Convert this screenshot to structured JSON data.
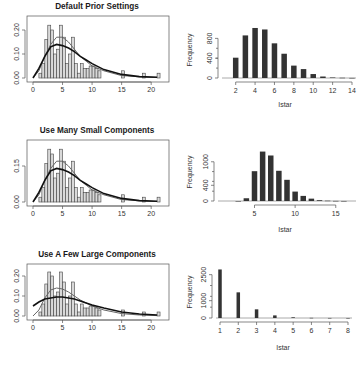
{
  "chart_data": [
    {
      "type": "bar",
      "panel": "row1-left",
      "title": "Default Prior Settings",
      "xlabel": "",
      "ylabel": "",
      "xlim": [
        0,
        22
      ],
      "ylim": [
        0,
        0.25
      ],
      "xticks": [
        "0",
        "5",
        "10",
        "15",
        "20"
      ],
      "yticks": [
        "0.00",
        "0.10",
        "0.20"
      ],
      "histogram": {
        "bin_width": 0.5,
        "x": [
          1.0,
          1.5,
          2.0,
          2.5,
          3.0,
          3.5,
          4.0,
          4.5,
          5.0,
          5.5,
          6.0,
          6.5,
          7.0,
          7.5,
          8.0,
          8.5,
          9.0,
          9.5,
          10.0,
          10.5,
          11.0,
          15.0,
          18.5,
          21.0
        ],
        "density": [
          0.02,
          0.06,
          0.16,
          0.22,
          0.2,
          0.1,
          0.12,
          0.22,
          0.17,
          0.06,
          0.1,
          0.17,
          0.06,
          0.02,
          0.06,
          0.04,
          0.04,
          0.05,
          0.05,
          0.04,
          0.03,
          0.03,
          0.02,
          0.02
        ]
      },
      "curves": [
        {
          "name": "true density",
          "x": [
            0,
            1,
            2,
            3,
            4,
            5,
            6,
            7,
            8,
            9,
            10,
            12,
            15,
            18,
            21
          ],
          "y": [
            0.0,
            0.03,
            0.09,
            0.14,
            0.17,
            0.17,
            0.15,
            0.12,
            0.09,
            0.07,
            0.05,
            0.03,
            0.01,
            0.005,
            0.002
          ]
        },
        {
          "name": "posterior mean",
          "x": [
            0,
            1,
            2,
            3,
            4,
            5,
            6,
            7,
            8,
            9,
            10,
            12,
            15,
            18,
            21
          ],
          "y": [
            0.0,
            0.04,
            0.09,
            0.13,
            0.14,
            0.135,
            0.125,
            0.11,
            0.09,
            0.075,
            0.06,
            0.035,
            0.015,
            0.006,
            0.003
          ]
        }
      ]
    },
    {
      "type": "bar",
      "panel": "row1-right",
      "title": "",
      "xlabel": "Istar",
      "ylabel": "Frequency",
      "xlim": [
        1,
        14
      ],
      "ylim": [
        0,
        1050
      ],
      "xticks": [
        "2",
        "4",
        "6",
        "8",
        "10",
        "12",
        "14"
      ],
      "yticks": [
        "0",
        "400",
        "800"
      ],
      "categories": [
        2,
        3,
        4,
        5,
        6,
        7,
        8,
        9,
        10,
        11,
        12,
        13,
        14
      ],
      "values": [
        410,
        860,
        1010,
        980,
        700,
        490,
        250,
        180,
        80,
        30,
        10,
        5,
        2
      ]
    },
    {
      "type": "bar",
      "panel": "row2-left",
      "title": "Use Many Small Components",
      "xlabel": "",
      "ylabel": "",
      "xlim": [
        0,
        22
      ],
      "ylim": [
        0,
        0.25
      ],
      "xticks": [
        "0",
        "5",
        "10",
        "15",
        "20"
      ],
      "yticks": [
        "0.00",
        "0.15"
      ],
      "histogram": {
        "bin_width": 0.5,
        "x": [
          1.0,
          1.5,
          2.0,
          2.5,
          3.0,
          3.5,
          4.0,
          4.5,
          5.0,
          5.5,
          6.0,
          6.5,
          7.0,
          7.5,
          8.0,
          8.5,
          9.0,
          9.5,
          10.0,
          10.5,
          11.0,
          15.0,
          18.5,
          21.0
        ],
        "density": [
          0.02,
          0.06,
          0.16,
          0.22,
          0.2,
          0.1,
          0.12,
          0.22,
          0.17,
          0.06,
          0.1,
          0.17,
          0.06,
          0.02,
          0.06,
          0.04,
          0.04,
          0.05,
          0.05,
          0.04,
          0.03,
          0.03,
          0.02,
          0.02
        ]
      },
      "curves": [
        {
          "name": "true density",
          "x": [
            0,
            1,
            2,
            3,
            4,
            5,
            6,
            7,
            8,
            9,
            10,
            12,
            15,
            18,
            21
          ],
          "y": [
            0.0,
            0.03,
            0.09,
            0.14,
            0.17,
            0.17,
            0.15,
            0.12,
            0.09,
            0.07,
            0.05,
            0.03,
            0.01,
            0.005,
            0.002
          ]
        },
        {
          "name": "posterior mean",
          "x": [
            0,
            1,
            2,
            3,
            4,
            5,
            6,
            7,
            8,
            9,
            10,
            12,
            15,
            18,
            21
          ],
          "y": [
            0.0,
            0.04,
            0.09,
            0.13,
            0.14,
            0.135,
            0.125,
            0.11,
            0.09,
            0.075,
            0.06,
            0.035,
            0.015,
            0.006,
            0.003
          ]
        }
      ]
    },
    {
      "type": "bar",
      "panel": "row2-right",
      "title": "",
      "xlabel": "Istar",
      "ylabel": "Frequency",
      "xlim": [
        1,
        17
      ],
      "ylim": [
        0,
        1300
      ],
      "xticks": [
        "5",
        "10",
        "15"
      ],
      "yticks": [
        "0",
        "400",
        "1000"
      ],
      "categories": [
        3,
        4,
        5,
        6,
        7,
        8,
        9,
        10,
        11,
        12,
        13,
        14,
        15,
        16
      ],
      "values": [
        0,
        70,
        760,
        1260,
        1160,
        770,
        540,
        240,
        130,
        60,
        20,
        8,
        3,
        1
      ]
    },
    {
      "type": "bar",
      "panel": "row3-left",
      "title": "Use A Few Large Components",
      "xlabel": "",
      "ylabel": "",
      "xlim": [
        0,
        22
      ],
      "ylim": [
        0,
        0.25
      ],
      "xticks": [
        "0",
        "5",
        "10",
        "15",
        "20"
      ],
      "yticks": [
        "0.00",
        "0.10",
        "0.20"
      ],
      "histogram": {
        "bin_width": 0.5,
        "x": [
          1.0,
          1.5,
          2.0,
          2.5,
          3.0,
          3.5,
          4.0,
          4.5,
          5.0,
          5.5,
          6.0,
          6.5,
          7.0,
          7.5,
          8.0,
          8.5,
          9.0,
          9.5,
          10.0,
          10.5,
          11.0,
          15.0,
          18.5,
          21.0
        ],
        "density": [
          0.02,
          0.06,
          0.16,
          0.22,
          0.2,
          0.1,
          0.12,
          0.22,
          0.17,
          0.06,
          0.1,
          0.17,
          0.06,
          0.02,
          0.06,
          0.04,
          0.04,
          0.05,
          0.05,
          0.04,
          0.03,
          0.03,
          0.02,
          0.02
        ]
      },
      "curves": [
        {
          "name": "true density",
          "x": [
            0,
            1,
            2,
            3,
            4,
            5,
            6,
            7,
            8,
            9,
            10,
            12,
            15,
            18,
            21
          ],
          "y": [
            0.0,
            0.03,
            0.09,
            0.13,
            0.14,
            0.135,
            0.12,
            0.1,
            0.08,
            0.065,
            0.05,
            0.03,
            0.012,
            0.005,
            0.002
          ]
        },
        {
          "name": "posterior mean",
          "x": [
            0,
            1,
            2,
            3,
            4,
            5,
            6,
            7,
            8,
            9,
            10,
            12,
            15,
            18,
            21
          ],
          "y": [
            0.05,
            0.07,
            0.085,
            0.09,
            0.095,
            0.095,
            0.09,
            0.085,
            0.075,
            0.065,
            0.055,
            0.04,
            0.02,
            0.01,
            0.005
          ]
        }
      ]
    },
    {
      "type": "bar",
      "panel": "row3-right",
      "title": "",
      "xlabel": "Istar",
      "ylabel": "Frequency",
      "xlim": [
        1,
        8
      ],
      "ylim": [
        0,
        3000
      ],
      "xticks": [
        "1",
        "2",
        "3",
        "4",
        "5",
        "6",
        "7",
        "8"
      ],
      "yticks": [
        "0",
        "1000",
        "2500"
      ],
      "categories": [
        1,
        2,
        3,
        4,
        5,
        6,
        7,
        8
      ],
      "values": [
        2800,
        1480,
        500,
        150,
        40,
        10,
        3,
        1
      ]
    }
  ]
}
